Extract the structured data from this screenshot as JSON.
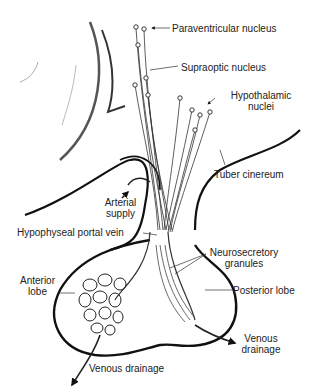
{
  "diagram": {
    "labels": {
      "paraventricular": "Paraventricular nucleus",
      "supraoptic": "Supraoptic nucleus",
      "hypothalamic_1": "Hypothalamic",
      "hypothalamic_2": "nuclei",
      "tuber": "Tuber cinereum",
      "arterial_1": "Arterial",
      "arterial_2": "supply",
      "portal_vein": "Hypophyseal portal vein",
      "neuro_1": "Neurosecretory",
      "neuro_2": "granules",
      "anterior_1": "Anterior",
      "anterior_2": "lobe",
      "posterior": "Posterior lobe",
      "venous_right_1": "Venous",
      "venous_right_2": "drainage",
      "venous_bottom": "Venous drainage"
    },
    "colors": {
      "line": "#111111",
      "text": "#222222",
      "background": "#ffffff"
    }
  }
}
